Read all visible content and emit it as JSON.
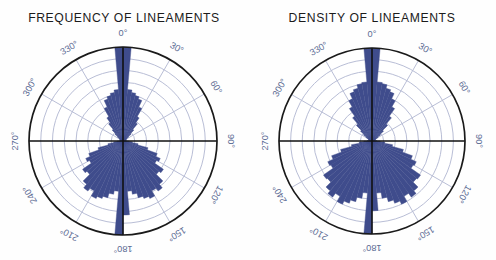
{
  "figure": {
    "background_color": "#fefefe",
    "width": 496,
    "height": 260
  },
  "style": {
    "petal_fill": "#3f4c8c",
    "petal_stroke": "#2b3569",
    "grid_color": "#b9bed6",
    "outer_circle_color": "#1a1a1a",
    "axis_color": "#111111",
    "label_color": "#5b6a93",
    "title_color": "#1b1b1b"
  },
  "panels": [
    {
      "id": "frequency",
      "title": "FREQUENCY OF  LINEAMENTS",
      "center": {
        "x": 123,
        "y": 141
      },
      "radius": 94,
      "grid_rings": 8,
      "spoke_interval_deg": 30,
      "tick_labels": [
        "0°",
        "30°",
        "60°",
        "90°",
        "120°",
        "150°",
        "180°",
        "210°",
        "240°",
        "270°",
        "300°",
        "330°"
      ]
    },
    {
      "id": "density",
      "title": "DENSITY OF  LINEAMENTS",
      "center": {
        "x": 124,
        "y": 141
      },
      "radius": 93,
      "grid_rings": 8,
      "spoke_interval_deg": 30,
      "tick_labels": [
        "0°",
        "30°",
        "60°",
        "90°",
        "120°",
        "150°",
        "180°",
        "210°",
        "240°",
        "270°",
        "300°",
        "330°"
      ]
    }
  ],
  "chart_data": [
    {
      "type": "bar",
      "subtype": "rose-diagram",
      "title": "FREQUENCY OF  LINEAMENTS",
      "xlabel": "",
      "ylabel": "",
      "angular_units": "degrees",
      "bin_width_deg": 5,
      "orientation": "compass-clockwise-from-north",
      "rlim": [
        0,
        8
      ],
      "grid": true,
      "legend": "none",
      "axis_tick_labels": [
        "0°",
        "30°",
        "60°",
        "90°",
        "120°",
        "150°",
        "180°",
        "210°",
        "240°",
        "270°",
        "300°",
        "330°"
      ],
      "bin_centers_deg": [
        2.5,
        7.5,
        12.5,
        17.5,
        22.5,
        27.5,
        32.5,
        37.5,
        42.5,
        47.5,
        52.5,
        57.5,
        62.5,
        67.5,
        72.5,
        77.5,
        82.5,
        87.5,
        92.5,
        97.5,
        102.5,
        107.5,
        112.5,
        117.5,
        122.5,
        127.5,
        132.5,
        137.5,
        142.5,
        147.5,
        152.5,
        157.5,
        162.5,
        167.5,
        172.5,
        177.5,
        182.5,
        187.5,
        192.5,
        197.5,
        202.5,
        207.5,
        212.5,
        217.5,
        222.5,
        227.5,
        232.5,
        237.5,
        242.5,
        247.5,
        252.5,
        257.5,
        262.5,
        267.5,
        272.5,
        277.5,
        282.5,
        287.5,
        292.5,
        297.5,
        302.5,
        307.5,
        312.5,
        317.5,
        322.5,
        327.5,
        332.5,
        337.5,
        342.5,
        347.5,
        352.5,
        357.5
      ],
      "values": [
        8.0,
        4.4,
        4.2,
        4.0,
        3.8,
        3.2,
        2.4,
        1.9,
        1.3,
        0.9,
        0.6,
        0.4,
        0.3,
        0.3,
        0.2,
        0.2,
        0.2,
        0.3,
        0.5,
        0.8,
        1.3,
        2.2,
        3.1,
        3.5,
        3.3,
        4.2,
        4.0,
        4.8,
        5.2,
        4.9,
        5.4,
        5.2,
        5.0,
        4.6,
        4.3,
        6.3,
        8.0,
        4.3,
        4.6,
        5.0,
        5.2,
        5.4,
        4.9,
        5.2,
        4.8,
        4.0,
        4.2,
        3.3,
        3.5,
        3.1,
        2.2,
        1.3,
        0.8,
        0.5,
        0.3,
        0.2,
        0.2,
        0.2,
        0.3,
        0.3,
        0.4,
        0.6,
        0.9,
        1.3,
        1.9,
        2.4,
        3.2,
        3.8,
        4.0,
        4.2,
        4.4,
        8.0
      ]
    },
    {
      "type": "bar",
      "subtype": "rose-diagram",
      "title": "DENSITY OF  LINEAMENTS",
      "xlabel": "",
      "ylabel": "",
      "angular_units": "degrees",
      "bin_width_deg": 5,
      "orientation": "compass-clockwise-from-north",
      "rlim": [
        0,
        8
      ],
      "grid": true,
      "legend": "none",
      "axis_tick_labels": [
        "0°",
        "30°",
        "60°",
        "90°",
        "120°",
        "150°",
        "180°",
        "210°",
        "240°",
        "270°",
        "300°",
        "330°"
      ],
      "bin_centers_deg": [
        2.5,
        7.5,
        12.5,
        17.5,
        22.5,
        27.5,
        32.5,
        37.5,
        42.5,
        47.5,
        52.5,
        57.5,
        62.5,
        67.5,
        72.5,
        77.5,
        82.5,
        87.5,
        92.5,
        97.5,
        102.5,
        107.5,
        112.5,
        117.5,
        122.5,
        127.5,
        132.5,
        137.5,
        142.5,
        147.5,
        152.5,
        157.5,
        162.5,
        167.5,
        172.5,
        177.5,
        182.5,
        187.5,
        192.5,
        197.5,
        202.5,
        207.5,
        212.5,
        217.5,
        222.5,
        227.5,
        232.5,
        237.5,
        242.5,
        247.5,
        252.5,
        257.5,
        262.5,
        267.5,
        272.5,
        277.5,
        282.5,
        287.5,
        292.5,
        297.5,
        302.5,
        307.5,
        312.5,
        317.5,
        322.5,
        327.5,
        332.5,
        337.5,
        342.5,
        347.5,
        352.5,
        357.5
      ],
      "values": [
        8.0,
        5.1,
        5.0,
        4.7,
        4.5,
        4.0,
        3.4,
        2.6,
        1.9,
        1.3,
        0.9,
        0.6,
        0.4,
        0.3,
        0.3,
        0.2,
        0.2,
        0.4,
        0.7,
        1.1,
        1.8,
        2.8,
        3.7,
        4.2,
        4.1,
        5.1,
        5.0,
        5.6,
        5.9,
        5.5,
        6.0,
        5.7,
        5.4,
        5.0,
        4.5,
        6.0,
        8.0,
        4.5,
        5.0,
        5.4,
        5.7,
        6.0,
        5.5,
        5.9,
        5.6,
        5.0,
        5.1,
        4.1,
        4.2,
        3.7,
        2.8,
        1.8,
        1.1,
        0.7,
        0.4,
        0.2,
        0.2,
        0.3,
        0.3,
        0.4,
        0.6,
        0.9,
        1.3,
        1.9,
        2.6,
        3.4,
        4.0,
        4.5,
        4.7,
        5.0,
        5.1,
        8.0
      ]
    }
  ]
}
